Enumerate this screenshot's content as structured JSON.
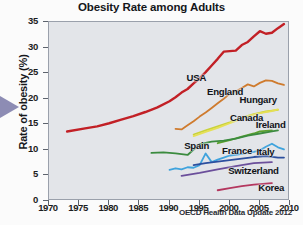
{
  "chart_data": {
    "type": "line",
    "title": "Obesity Rate among Adults",
    "xlabel": "",
    "ylabel": "Rate of obesity (%)",
    "xlim": [
      1970,
      2010
    ],
    "ylim": [
      0,
      35
    ],
    "xticks": [
      "1970",
      "1975",
      "1980",
      "1985",
      "1990",
      "1995",
      "2000",
      "2005",
      "2010"
    ],
    "yticks": [
      "0",
      "5",
      "10",
      "15",
      "20",
      "25",
      "30",
      "35"
    ],
    "grid": false,
    "legend": "inline-labels",
    "source": "OECD Health Data Update 2012",
    "series": [
      {
        "name": "USA",
        "color": "#c22026",
        "label": "USA",
        "points": [
          [
            1973,
            13.6
          ],
          [
            1976,
            14.2
          ],
          [
            1978,
            14.6
          ],
          [
            1980,
            15.2
          ],
          [
            1982,
            15.9
          ],
          [
            1984,
            16.6
          ],
          [
            1986,
            17.4
          ],
          [
            1988,
            18.3
          ],
          [
            1990,
            19.5
          ],
          [
            1991,
            20.3
          ],
          [
            1992,
            21.2
          ],
          [
            1993,
            21.9
          ],
          [
            1994,
            23.0
          ],
          [
            1995,
            24.0
          ],
          [
            1996,
            25.2
          ],
          [
            1997,
            26.5
          ],
          [
            1998,
            27.8
          ],
          [
            1999,
            29.2
          ],
          [
            2000,
            29.3
          ],
          [
            2001,
            29.4
          ],
          [
            2002,
            30.5
          ],
          [
            2003,
            31.1
          ],
          [
            2004,
            32.2
          ],
          [
            2005,
            33.2
          ],
          [
            2006,
            32.7
          ],
          [
            2007,
            32.9
          ],
          [
            2008,
            33.8
          ],
          [
            2009,
            34.6
          ]
        ]
      },
      {
        "name": "England",
        "color": "#cf7b2e",
        "label": "England",
        "points": [
          [
            1991,
            14.1
          ],
          [
            1992,
            14.0
          ],
          [
            1993,
            14.8
          ],
          [
            1994,
            15.6
          ],
          [
            1995,
            16.5
          ],
          [
            1996,
            17.3
          ],
          [
            1997,
            18.2
          ],
          [
            1998,
            19.1
          ],
          [
            1999,
            20.0
          ],
          [
            2000,
            21.0
          ],
          [
            2001,
            21.4
          ],
          [
            2002,
            22.1
          ],
          [
            2003,
            22.8
          ],
          [
            2004,
            22.4
          ],
          [
            2005,
            23.1
          ],
          [
            2006,
            23.6
          ],
          [
            2007,
            23.5
          ],
          [
            2008,
            23.0
          ],
          [
            2009,
            22.7
          ]
        ]
      },
      {
        "name": "Hungary",
        "color": "#c9d23a",
        "label": "Hungary",
        "points": [
          [
            1994,
            13.0
          ],
          [
            1996,
            13.8
          ],
          [
            1998,
            14.6
          ],
          [
            2000,
            15.4
          ],
          [
            2002,
            16.3
          ],
          [
            2004,
            17.0
          ],
          [
            2006,
            17.5
          ],
          [
            2008,
            17.8
          ]
        ]
      },
      {
        "name": "Canada",
        "color": "#e6e055",
        "label": "Canada",
        "points": [
          [
            1994,
            12.7
          ],
          [
            1996,
            13.5
          ],
          [
            1998,
            14.3
          ],
          [
            2000,
            15.2
          ],
          [
            2002,
            16.1
          ],
          [
            2003,
            16.6
          ],
          [
            2005,
            17.2
          ],
          [
            2007,
            17.6
          ],
          [
            2008,
            17.9
          ]
        ]
      },
      {
        "name": "Ireland",
        "color": "#5aa02c",
        "label": "Ireland",
        "points": [
          [
            1998,
            11.3
          ],
          [
            2000,
            11.9
          ],
          [
            2002,
            12.6
          ],
          [
            2004,
            13.2
          ],
          [
            2005,
            13.6
          ],
          [
            2007,
            13.8
          ]
        ]
      },
      {
        "name": "Spain",
        "color": "#3b8b3f",
        "label": "Spain",
        "points": [
          [
            1987,
            9.4
          ],
          [
            1989,
            9.5
          ],
          [
            1991,
            9.3
          ],
          [
            1993,
            9.0
          ],
          [
            1995,
            11.1
          ],
          [
            1997,
            11.6
          ],
          [
            1999,
            11.8
          ],
          [
            2001,
            12.2
          ],
          [
            2003,
            12.8
          ],
          [
            2005,
            13.2
          ],
          [
            2007,
            13.6
          ],
          [
            2008,
            13.8
          ]
        ]
      },
      {
        "name": "France",
        "color": "#3fa3dd",
        "label": "France",
        "points": [
          [
            1990,
            6.1
          ],
          [
            1991,
            6.4
          ],
          [
            1992,
            6.2
          ],
          [
            1993,
            6.6
          ],
          [
            1994,
            6.5
          ],
          [
            1995,
            7.0
          ],
          [
            1996,
            9.3
          ],
          [
            1997,
            7.6
          ],
          [
            1998,
            8.1
          ],
          [
            1999,
            8.5
          ],
          [
            2000,
            8.9
          ],
          [
            2001,
            9.0
          ],
          [
            2002,
            9.2
          ],
          [
            2003,
            9.4
          ],
          [
            2004,
            9.6
          ],
          [
            2005,
            9.9
          ],
          [
            2006,
            10.6
          ],
          [
            2007,
            11.2
          ],
          [
            2008,
            10.5
          ],
          [
            2009,
            10.1
          ]
        ]
      },
      {
        "name": "Italy",
        "color": "#2c4f9e",
        "label": "Italy",
        "points": [
          [
            1994,
            7.0
          ],
          [
            1996,
            7.4
          ],
          [
            1998,
            7.7
          ],
          [
            2000,
            8.0
          ],
          [
            2002,
            8.3
          ],
          [
            2004,
            8.6
          ],
          [
            2006,
            8.8
          ],
          [
            2008,
            8.5
          ],
          [
            2009,
            8.5
          ]
        ]
      },
      {
        "name": "Switzerland",
        "color": "#6b4f9b",
        "label": "Switzerland",
        "points": [
          [
            1992,
            4.9
          ],
          [
            1995,
            5.5
          ],
          [
            1998,
            6.2
          ],
          [
            2001,
            6.8
          ],
          [
            2004,
            7.4
          ],
          [
            2007,
            7.6
          ]
        ]
      },
      {
        "name": "Korea",
        "color": "#b4375f",
        "label": "Korea",
        "points": [
          [
            1998,
            2.1
          ],
          [
            2000,
            2.5
          ],
          [
            2002,
            2.9
          ],
          [
            2004,
            3.2
          ],
          [
            2006,
            3.4
          ],
          [
            2007,
            3.5
          ]
        ]
      }
    ],
    "annotations": [
      {
        "text": "USA",
        "x": 1993.0,
        "y": 23.8
      },
      {
        "text": "England",
        "x": 1996.4,
        "y": 21.2
      },
      {
        "text": "Hungary",
        "x": 2001.8,
        "y": 19.6
      },
      {
        "text": "Canada",
        "x": 2000.2,
        "y": 16.0
      },
      {
        "text": "Ireland",
        "x": 2004.5,
        "y": 14.6
      },
      {
        "text": "Spain",
        "x": 1992.6,
        "y": 10.6
      },
      {
        "text": "France",
        "x": 1998.9,
        "y": 9.5
      },
      {
        "text": "Italy",
        "x": 2004.6,
        "y": 9.3
      },
      {
        "text": "Switzerland",
        "x": 1999.9,
        "y": 5.7
      },
      {
        "text": "Korea",
        "x": 2004.9,
        "y": 2.3
      }
    ]
  },
  "decor": {
    "arrow_color": "#8d8cb4",
    "plot_background": "#e3e5e9",
    "page_background": "#fbfbfb"
  }
}
